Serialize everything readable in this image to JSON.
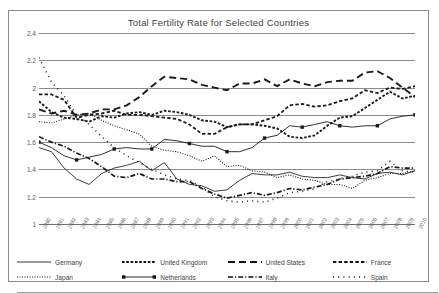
{
  "chart_data": {
    "type": "line",
    "title": "Total Fertility Rate for Selected Countries",
    "xlabel": "",
    "ylabel": "",
    "ylim": [
      1,
      2.4
    ],
    "yticks": [
      "1",
      "1.2",
      "1.4",
      "1.6",
      "1.8",
      "2",
      "2.2",
      "2.4"
    ],
    "ytick_values": [
      1,
      1.2,
      1.4,
      1.6,
      1.8,
      2,
      2.2,
      2.4
    ],
    "grid": true,
    "legend_position": "bottom",
    "x": [
      1980,
      1981,
      1982,
      1983,
      1984,
      1985,
      1986,
      1987,
      1988,
      1989,
      1990,
      1991,
      1992,
      1993,
      1994,
      1995,
      1996,
      1997,
      1998,
      1999,
      2000,
      2001,
      2002,
      2003,
      2004,
      2005,
      2006,
      2007,
      2008,
      2009,
      2010
    ],
    "categories": [
      "1980",
      "1981",
      "1982",
      "1983",
      "1984",
      "1985",
      "1986",
      "1987",
      "1988",
      "1989",
      "1990",
      "1991",
      "1992",
      "1993",
      "1994",
      "1995",
      "1996",
      "1997",
      "1998",
      "1999",
      "2000",
      "2001",
      "2002",
      "2003",
      "2004",
      "2005",
      "2006",
      "2007",
      "2008",
      "2009",
      "2010"
    ],
    "series": [
      {
        "name": "Germany",
        "style": "solid",
        "values": [
          1.56,
          1.53,
          1.41,
          1.33,
          1.29,
          1.37,
          1.41,
          1.43,
          1.46,
          1.39,
          1.45,
          1.33,
          1.29,
          1.28,
          1.24,
          1.25,
          1.32,
          1.37,
          1.36,
          1.36,
          1.38,
          1.35,
          1.34,
          1.34,
          1.36,
          1.34,
          1.33,
          1.37,
          1.38,
          1.36,
          1.39
        ]
      },
      {
        "name": "United Kingdom",
        "style": "dotted-square",
        "values": [
          1.9,
          1.82,
          1.78,
          1.77,
          1.75,
          1.79,
          1.78,
          1.81,
          1.82,
          1.8,
          1.83,
          1.82,
          1.8,
          1.76,
          1.75,
          1.71,
          1.73,
          1.73,
          1.72,
          1.7,
          1.64,
          1.63,
          1.65,
          1.72,
          1.78,
          1.79,
          1.85,
          1.91,
          1.97,
          1.92,
          1.94
        ]
      },
      {
        "name": "United States",
        "style": "longdash",
        "values": [
          1.84,
          1.81,
          1.83,
          1.8,
          1.81,
          1.84,
          1.84,
          1.87,
          1.93,
          2.01,
          2.08,
          2.07,
          2.06,
          2.02,
          2.0,
          1.98,
          2.03,
          2.03,
          2.06,
          2.01,
          2.06,
          2.03,
          2.01,
          2.04,
          2.05,
          2.05,
          2.11,
          2.12,
          2.07,
          2.0,
          1.93
        ]
      },
      {
        "name": "France",
        "style": "dashed-square",
        "values": [
          1.95,
          1.95,
          1.91,
          1.78,
          1.8,
          1.81,
          1.83,
          1.8,
          1.8,
          1.79,
          1.78,
          1.77,
          1.73,
          1.66,
          1.66,
          1.71,
          1.73,
          1.73,
          1.76,
          1.79,
          1.87,
          1.88,
          1.86,
          1.87,
          1.9,
          1.92,
          1.98,
          1.96,
          2.0,
          1.99,
          2.01
        ]
      },
      {
        "name": "Japan",
        "style": "fine-dotted",
        "values": [
          1.75,
          1.74,
          1.77,
          1.8,
          1.81,
          1.76,
          1.72,
          1.69,
          1.66,
          1.57,
          1.54,
          1.53,
          1.5,
          1.46,
          1.5,
          1.42,
          1.43,
          1.39,
          1.38,
          1.34,
          1.36,
          1.33,
          1.32,
          1.29,
          1.29,
          1.26,
          1.32,
          1.34,
          1.37,
          1.37,
          1.39
        ]
      },
      {
        "name": "Netherlands",
        "style": "solid-marker",
        "values": [
          1.6,
          1.56,
          1.5,
          1.47,
          1.49,
          1.51,
          1.55,
          1.56,
          1.55,
          1.55,
          1.62,
          1.61,
          1.59,
          1.57,
          1.57,
          1.53,
          1.53,
          1.56,
          1.63,
          1.65,
          1.72,
          1.71,
          1.73,
          1.75,
          1.72,
          1.71,
          1.72,
          1.72,
          1.77,
          1.79,
          1.8
        ]
      },
      {
        "name": "Italy",
        "style": "dashdot",
        "values": [
          1.64,
          1.6,
          1.57,
          1.52,
          1.48,
          1.42,
          1.35,
          1.34,
          1.37,
          1.33,
          1.33,
          1.31,
          1.31,
          1.26,
          1.22,
          1.19,
          1.21,
          1.23,
          1.21,
          1.23,
          1.26,
          1.25,
          1.27,
          1.29,
          1.33,
          1.34,
          1.35,
          1.37,
          1.42,
          1.41,
          1.41
        ]
      },
      {
        "name": "Spain",
        "style": "sparse-dotted",
        "values": [
          2.22,
          2.04,
          1.94,
          1.8,
          1.73,
          1.64,
          1.56,
          1.5,
          1.45,
          1.4,
          1.36,
          1.33,
          1.32,
          1.27,
          1.2,
          1.17,
          1.16,
          1.17,
          1.16,
          1.19,
          1.23,
          1.24,
          1.26,
          1.31,
          1.33,
          1.35,
          1.38,
          1.39,
          1.46,
          1.39,
          1.38
        ]
      }
    ]
  },
  "legend": {
    "row1": [
      {
        "label": "Germany",
        "key": "solid"
      },
      {
        "label": "United Kingdom",
        "key": "dotted-square"
      },
      {
        "label": "United States",
        "key": "longdash"
      },
      {
        "label": "France",
        "key": "dashed-square"
      }
    ],
    "row2": [
      {
        "label": "Japan",
        "key": "fine-dotted"
      },
      {
        "label": "Netherlands",
        "key": "solid-marker"
      },
      {
        "label": "Italy",
        "key": "dashdot"
      },
      {
        "label": "Spain",
        "key": "sparse-dotted"
      }
    ]
  },
  "colors": {
    "line": "#1a1a1a",
    "grid": "#8c8c8c",
    "text": "#444444",
    "frame": "#8a8a8a"
  }
}
